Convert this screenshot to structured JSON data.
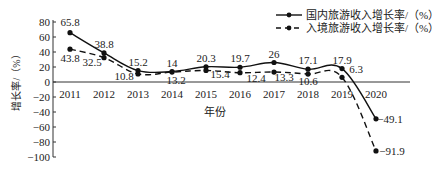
{
  "chart_data": {
    "type": "line",
    "title": "",
    "xlabel": "年份",
    "ylabel": "增长率/（%）",
    "ylim": [
      -100,
      80
    ],
    "yticks": [
      80,
      60,
      40,
      20,
      0,
      -20,
      -40,
      -60,
      -80,
      -100
    ],
    "categories": [
      "2011",
      "2012",
      "2013",
      "2014",
      "2015",
      "2016",
      "2017",
      "2018",
      "2019",
      "2020"
    ],
    "series": [
      {
        "name": "国内旅游收入增长率/（%）",
        "style": "solid",
        "values": [
          65.8,
          38.8,
          15.2,
          14,
          20.3,
          19.7,
          26,
          17.1,
          17.9,
          -49.1
        ]
      },
      {
        "name": "入境旅游收入增长率/（%）",
        "style": "dashed",
        "values": [
          43.8,
          32.5,
          10.8,
          13.2,
          15.4,
          12.4,
          13.3,
          10.6,
          6.3,
          -91.9
        ]
      }
    ],
    "grid": false,
    "legend_position": "top-right"
  }
}
